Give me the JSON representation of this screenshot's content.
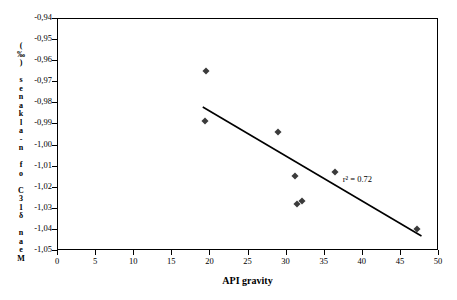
{
  "chart_data": {
    "type": "scatter",
    "title": "",
    "xlabel": "API gravity",
    "ylabel": "M e a n   δ 13 C   o f   n - a l k a n e s   ( ‰ )",
    "ylabel_chars": [
      "(",
      "‰",
      ")",
      " ",
      "s",
      "e",
      "n",
      "a",
      "k",
      "l",
      "a",
      "-",
      "n",
      " ",
      "f",
      "o",
      " ",
      "C",
      "3",
      "1",
      "δ",
      " ",
      "n",
      "a",
      "e",
      "M"
    ],
    "xlim": [
      0,
      50
    ],
    "ylim": [
      -1.05,
      -0.94
    ],
    "xticks": [
      "0",
      "5",
      "10",
      "15",
      "20",
      "25",
      "30",
      "35",
      "40",
      "45",
      "50"
    ],
    "yticks": [
      "-0,94",
      "-0,95",
      "-0,96",
      "-0,97",
      "-0,98",
      "-0,99",
      "-1,00",
      "-1,01",
      "-1,02",
      "-1,03",
      "-1,04",
      "-1,05"
    ],
    "grid": false,
    "legend": false,
    "points": [
      {
        "x": 19.4,
        "y": -0.9645
      },
      {
        "x": 19.3,
        "y": -0.9885
      },
      {
        "x": 28.9,
        "y": -0.9935
      },
      {
        "x": 31.1,
        "y": -1.0143
      },
      {
        "x": 31.4,
        "y": -1.0275
      },
      {
        "x": 32.0,
        "y": -1.0265
      },
      {
        "x": 36.4,
        "y": -1.0124
      },
      {
        "x": 47.1,
        "y": -1.0398
      }
    ],
    "trend_line": {
      "x1": 19.0,
      "y1": -0.9817,
      "x2": 47.7,
      "y2": -1.0429
    },
    "annotation": {
      "text": "r² = 0.72",
      "x": 37.5,
      "y": -1.0165
    },
    "marker_color": "#3b3b3b",
    "line_color": "#000000",
    "axis_color": "#000000"
  }
}
